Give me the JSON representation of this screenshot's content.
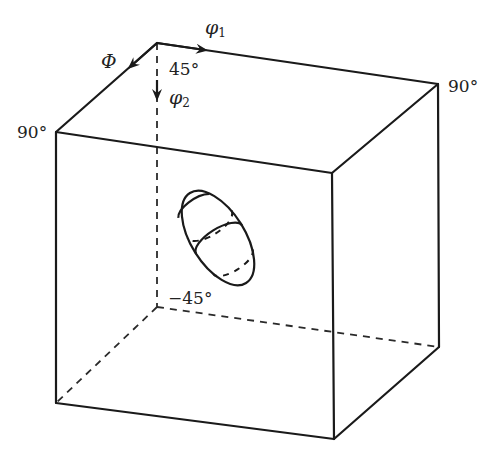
{
  "diagram": {
    "type": "3d-euler-space-cube",
    "colors": {
      "stroke": "#1a1a1a",
      "text": "#222222",
      "background": "#ffffff"
    },
    "axes": {
      "phi1": {
        "symbol": "φ",
        "subscript": "1"
      },
      "Phi": {
        "symbol": "Φ"
      },
      "phi2": {
        "symbol": "φ",
        "subscript": "2"
      }
    },
    "labels": {
      "top_left_front": "90°",
      "top_right_back": "90°",
      "phi2_start": "45°",
      "phi2_end": "−45°"
    },
    "feature": {
      "name": "ellipsoid-orientation-distribution",
      "description": "tilted ellipsoid with dashed cross-sections"
    }
  }
}
